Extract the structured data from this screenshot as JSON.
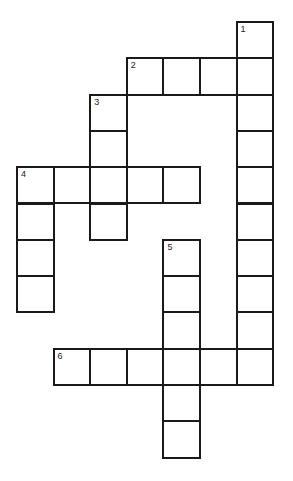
{
  "puzzle": {
    "origin_x": 16,
    "origin_y": 21,
    "cell_w": 36.6,
    "cell_h": 36.3,
    "words": [
      {
        "number": "1",
        "direction": "down",
        "row": 0,
        "col": 6,
        "length": 10
      },
      {
        "number": "2",
        "direction": "across",
        "row": 1,
        "col": 3,
        "length": 4
      },
      {
        "number": "3",
        "direction": "down",
        "row": 2,
        "col": 2,
        "length": 4
      },
      {
        "number": "4",
        "direction": "across",
        "row": 4,
        "col": 0,
        "length": 5
      },
      {
        "number": "4",
        "direction": "down",
        "row": 4,
        "col": 0,
        "length": 4
      },
      {
        "number": "5",
        "direction": "down",
        "row": 6,
        "col": 4,
        "length": 6
      },
      {
        "number": "6",
        "direction": "across",
        "row": 9,
        "col": 1,
        "length": 6
      }
    ],
    "colors": {
      "border": "#1a1a1a",
      "background": "#ffffff"
    }
  }
}
